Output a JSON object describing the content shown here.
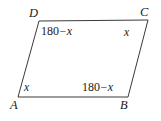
{
  "figure": {
    "type": "parallelogram",
    "background_color": "#ffffff",
    "stroke_color": "#3a3a3a",
    "stroke_width": 1,
    "vertices": [
      {
        "name": "A",
        "label": "A",
        "x": 18,
        "y": 97
      },
      {
        "name": "B",
        "label": "B",
        "x": 128,
        "y": 97
      },
      {
        "name": "C",
        "label": "C",
        "x": 148,
        "y": 20
      },
      {
        "name": "D",
        "label": "D",
        "x": 39,
        "y": 21
      }
    ],
    "vertex_labels": {
      "a": "A",
      "b": "B",
      "c": "C",
      "d": "D"
    },
    "angle_labels": {
      "a": {
        "text": "x",
        "parts": {
          "number": "",
          "operator": "",
          "variable": "x"
        }
      },
      "b": {
        "text": "180 − x",
        "parts": {
          "number": "180",
          "operator": "−",
          "variable": "x"
        }
      },
      "c": {
        "text": "x",
        "parts": {
          "number": "",
          "operator": "",
          "variable": "x"
        }
      },
      "d": {
        "text": "180 − x",
        "parts": {
          "number": "180",
          "operator": "−",
          "variable": "x"
        }
      }
    }
  }
}
